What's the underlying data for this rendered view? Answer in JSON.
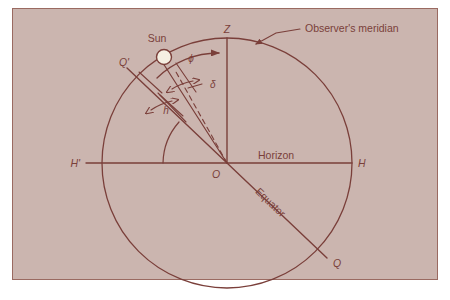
{
  "figure": {
    "type": "celestial-sphere-diagram",
    "background_color": "#cbb5af",
    "ink_color": "#7a3f3a",
    "frame_color": "#8a5a52",
    "sun_fill_color": "#f5efe2",
    "canvas": {
      "width": 450,
      "height": 300
    },
    "plate": {
      "x": 12,
      "y": 8,
      "width": 426,
      "height": 272
    }
  },
  "labels": {
    "sun": "Sun",
    "zenith": "Z",
    "observers_meridian": "Observer's meridian",
    "horizon": "Horizon",
    "horizon_east": "H",
    "horizon_west": "H'",
    "equator": "Equator",
    "equator_pole_upper": "Q'",
    "equator_pole_lower": "Q",
    "origin": "O",
    "angle_latitude": "ϕ",
    "angle_declination": "δ",
    "angle_altitude": "h"
  },
  "geometry": {
    "center": {
      "x": 227,
      "y": 163
    },
    "radius": 125,
    "horizon_left_x": 86,
    "horizon_right_x": 352,
    "zenith_y": 38,
    "sun_point": {
      "x": 164,
      "y": 57
    },
    "sun_radius": 7,
    "equator_angle_deg": 55,
    "notes": "Great circle is the observer's meridian; horizontal line H'-H is the horizon; line Q'-Q is the celestial equator inclined to the horizon."
  }
}
